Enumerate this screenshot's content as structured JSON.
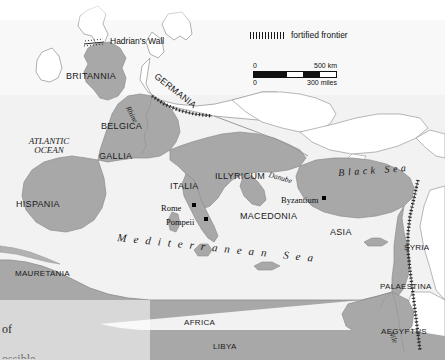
{
  "map": {
    "title": "Roman Empire map",
    "colors": {
      "roman_territory": "#a8a8a8",
      "outside_land": "#ffffff",
      "sea": "#f2f2f2",
      "coastline": "#8c8c8c",
      "frontier": "#2a2a2a"
    },
    "oceans": [
      {
        "name": "atlantic-ocean",
        "line1": "ATLANTIC",
        "line2": "OCEAN"
      }
    ],
    "seas": [
      {
        "name": "mediterranean-sea",
        "label": "Mediterranean Sea"
      },
      {
        "name": "black-sea",
        "label": "Black Sea"
      }
    ],
    "provinces": [
      {
        "name": "britannia",
        "label": "BRITANNIA"
      },
      {
        "name": "germania",
        "label": "GERMANIA"
      },
      {
        "name": "belgica",
        "label": "BELGICA"
      },
      {
        "name": "gallia",
        "label": "GALLIA"
      },
      {
        "name": "hispania",
        "label": "HISPANIA"
      },
      {
        "name": "italia",
        "label": "ITALIA"
      },
      {
        "name": "illyricum",
        "label": "ILLYRICUM"
      },
      {
        "name": "macedonia",
        "label": "MACEDONIA"
      },
      {
        "name": "asia",
        "label": "ASIA"
      },
      {
        "name": "syria",
        "label": "SYRIA"
      },
      {
        "name": "palaestina",
        "label": "PALAESTINA"
      },
      {
        "name": "aegyptus",
        "label": "AEGYPTUS"
      },
      {
        "name": "libya",
        "label": "LIBYA"
      },
      {
        "name": "africa",
        "label": "AFRICA"
      },
      {
        "name": "mauretania",
        "label": "MAURETANIA"
      }
    ],
    "cities": [
      {
        "name": "rome",
        "label": "Rome"
      },
      {
        "name": "pompeii",
        "label": "Pompeii"
      },
      {
        "name": "byzantium",
        "label": "Byzantium"
      }
    ],
    "rivers": [
      {
        "name": "rhine",
        "label": "Rhine"
      },
      {
        "name": "danube",
        "label": "Danube"
      },
      {
        "name": "nile",
        "label": "Nile"
      }
    ],
    "features": [
      {
        "name": "hadrians-wall",
        "label": "Hadrian's Wall"
      }
    ]
  },
  "legend": {
    "frontier_label": "fortified frontier",
    "scale": {
      "km_zero": "0",
      "km_max": "500 km",
      "miles_zero": "0",
      "miles_max": "300 miles"
    }
  },
  "page_text": {
    "fragment": "of"
  }
}
